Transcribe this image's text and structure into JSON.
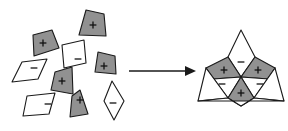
{
  "figure": {
    "background_color": "#ffffff",
    "outline_color": "#1a1a1a",
    "fill_gray": "#919191",
    "fill_white": "#ffffff",
    "sign_plus": "+",
    "sign_minus": "-",
    "width": 288,
    "height": 131
  },
  "arrow": {
    "name": "transformation-arrow",
    "label": "",
    "x1": 129,
    "y1": 71,
    "x2": 196,
    "y2": 71,
    "color": "#1a1a1a"
  },
  "scattered_tiles": [
    {
      "id": "tile-1",
      "sign": "+",
      "fill": "gray",
      "shape": "triangle-kite",
      "points": "86,10 104,14 106,36 79,35",
      "sign_x": 93,
      "sign_y": 25
    },
    {
      "id": "tile-2",
      "sign": "+",
      "fill": "gray",
      "shape": "triangle-kite",
      "points": "33,35 52,30 59,48 34,56",
      "sign_x": 43,
      "sign_y": 43
    },
    {
      "id": "tile-3",
      "sign": "-",
      "fill": "white",
      "shape": "parallelogram",
      "points": "62,45 84,40 86,63 64,68",
      "sign_x": 78,
      "sign_y": 59
    },
    {
      "id": "tile-4",
      "sign": "+",
      "fill": "gray",
      "shape": "triangle-kite",
      "points": "98,52 115,56 116,74 95,72",
      "sign_x": 104,
      "sign_y": 66
    },
    {
      "id": "tile-5",
      "sign": "-",
      "fill": "white",
      "shape": "parallelogram",
      "points": "22,62 47,59 38,79 12,82",
      "sign_x": 34,
      "sign_y": 68
    },
    {
      "id": "tile-6",
      "sign": "+",
      "fill": "gray",
      "shape": "triangle-kite",
      "points": "55,72 72,67 73,94 51,90",
      "sign_x": 62,
      "sign_y": 81
    },
    {
      "id": "tile-7",
      "sign": "-",
      "fill": "white",
      "shape": "parallelogram",
      "points": "27,96 55,93 49,114 23,116",
      "sign_x": 48,
      "sign_y": 104
    },
    {
      "id": "tile-8",
      "sign": "+",
      "fill": "gray",
      "shape": "triangle-kite",
      "points": "80,90 88,114 70,117 72,96",
      "sign_x": 80,
      "sign_y": 100
    },
    {
      "id": "tile-9",
      "sign": "-",
      "fill": "white",
      "shape": "rhombus",
      "points": "112,81 124,101 114,120 104,101",
      "sign_x": 113,
      "sign_y": 103
    }
  ],
  "assembled_tiles": [
    {
      "id": "assembled-top-white",
      "sign": "-",
      "fill": "white",
      "role": "upper-minus-kite",
      "points": "241,30 255,57 241,77 228,57",
      "sign_x": 241,
      "sign_y": 62
    },
    {
      "id": "assembled-left-gray",
      "sign": "+",
      "fill": "gray",
      "role": "upper-left-plus-kite",
      "points": "228,57 241,77 213,79 206,68",
      "sign_x": 224,
      "sign_y": 70
    },
    {
      "id": "assembled-right-gray",
      "sign": "+",
      "fill": "gray",
      "role": "upper-right-plus-kite",
      "points": "255,57 275,68 269,79 241,77",
      "sign_x": 258,
      "sign_y": 70
    },
    {
      "id": "assembled-left-white",
      "sign": "-",
      "fill": "white",
      "role": "lower-left-minus-kite",
      "points": "206,68 213,79 241,77 228,98",
      "sign_x": 222,
      "sign_y": 84
    },
    {
      "id": "assembled-right-white",
      "sign": "-",
      "fill": "white",
      "role": "lower-right-minus-kite",
      "points": "275,68 269,79 241,77 254,98",
      "sign_x": 260,
      "sign_y": 84
    },
    {
      "id": "assembled-bottom-gray",
      "sign": "+",
      "fill": "gray",
      "role": "lower-plus-kite",
      "points": "241,77 254,98 241,106 228,98",
      "sign_x": 241,
      "sign_y": 93
    },
    {
      "id": "assembled-outer-left",
      "sign": "",
      "fill": "white",
      "role": "outer-left-wing",
      "points": "206,68 228,98 198,101",
      "sign_x": 0,
      "sign_y": 0
    },
    {
      "id": "assembled-outer-right",
      "sign": "",
      "fill": "white",
      "role": "outer-right-wing",
      "points": "275,68 254,98 284,101",
      "sign_x": 0,
      "sign_y": 0
    },
    {
      "id": "assembled-outer-bottom",
      "sign": "",
      "fill": "white",
      "role": "outer-bottom-wing",
      "points": "228,98 241,106 254,98 284,101 198,101",
      "sign_x": 0,
      "sign_y": 0
    }
  ]
}
